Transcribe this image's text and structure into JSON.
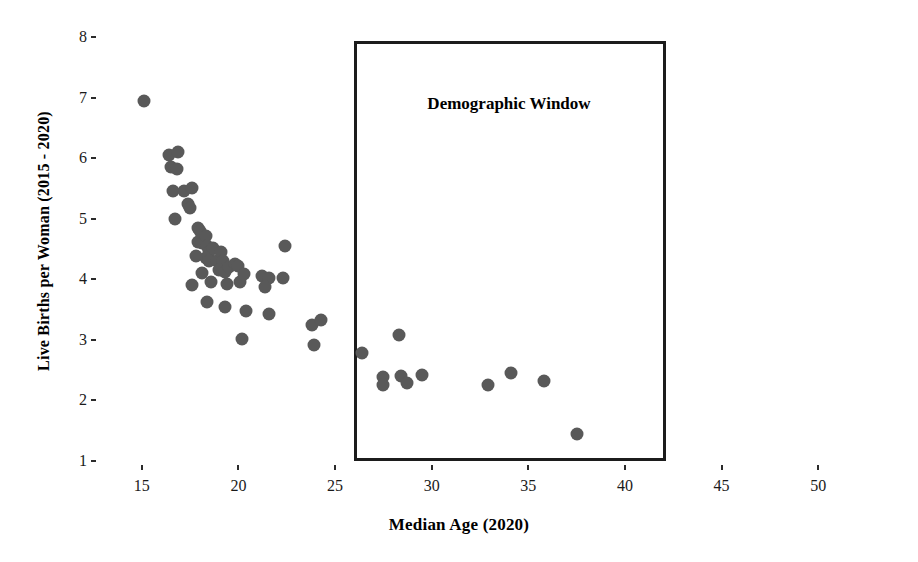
{
  "chart_data": {
    "type": "scatter",
    "title": "",
    "xlabel": "Median Age (2020)",
    "ylabel": "Live Births per Woman (2015 - 2020)",
    "xlim": [
      13.1,
      51.9
    ],
    "ylim": [
      1,
      8
    ],
    "xticks": [
      15,
      20,
      25,
      30,
      35,
      40,
      45,
      50
    ],
    "yticks": [
      1,
      2,
      3,
      4,
      5,
      6,
      7,
      8
    ],
    "grid": false,
    "legend": null,
    "marker_color": "#595959",
    "annotations": [
      {
        "name": "demographic-window",
        "label": "Demographic Window",
        "x_range": [
          26.0,
          42.1
        ],
        "y_range": [
          1.0,
          7.93
        ],
        "label_x": 34.0,
        "label_y": 6.9
      }
    ],
    "points": [
      {
        "x": 15.1,
        "y": 6.95
      },
      {
        "x": 16.4,
        "y": 6.05
      },
      {
        "x": 16.5,
        "y": 5.85
      },
      {
        "x": 16.9,
        "y": 6.1
      },
      {
        "x": 16.8,
        "y": 5.82
      },
      {
        "x": 16.6,
        "y": 5.45
      },
      {
        "x": 17.2,
        "y": 5.45
      },
      {
        "x": 17.6,
        "y": 5.5
      },
      {
        "x": 17.4,
        "y": 5.25
      },
      {
        "x": 17.5,
        "y": 5.18
      },
      {
        "x": 16.7,
        "y": 5.0
      },
      {
        "x": 17.9,
        "y": 4.85
      },
      {
        "x": 18.0,
        "y": 4.8
      },
      {
        "x": 17.9,
        "y": 4.62
      },
      {
        "x": 18.1,
        "y": 4.6
      },
      {
        "x": 18.3,
        "y": 4.72
      },
      {
        "x": 18.4,
        "y": 4.55
      },
      {
        "x": 18.5,
        "y": 4.45
      },
      {
        "x": 18.7,
        "y": 4.52
      },
      {
        "x": 18.3,
        "y": 4.35
      },
      {
        "x": 18.5,
        "y": 4.3
      },
      {
        "x": 18.9,
        "y": 4.3
      },
      {
        "x": 19.1,
        "y": 4.45
      },
      {
        "x": 19.2,
        "y": 4.3
      },
      {
        "x": 19.0,
        "y": 4.15
      },
      {
        "x": 19.3,
        "y": 4.12
      },
      {
        "x": 19.5,
        "y": 4.2
      },
      {
        "x": 19.8,
        "y": 4.25
      },
      {
        "x": 20.0,
        "y": 4.22
      },
      {
        "x": 18.1,
        "y": 4.1
      },
      {
        "x": 17.8,
        "y": 4.38
      },
      {
        "x": 18.6,
        "y": 3.95
      },
      {
        "x": 18.4,
        "y": 3.62
      },
      {
        "x": 17.6,
        "y": 3.9
      },
      {
        "x": 19.4,
        "y": 3.92
      },
      {
        "x": 19.3,
        "y": 3.55
      },
      {
        "x": 20.1,
        "y": 3.95
      },
      {
        "x": 20.3,
        "y": 4.08
      },
      {
        "x": 21.2,
        "y": 4.05
      },
      {
        "x": 21.6,
        "y": 4.02
      },
      {
        "x": 22.4,
        "y": 4.55
      },
      {
        "x": 22.3,
        "y": 4.02
      },
      {
        "x": 21.4,
        "y": 3.88
      },
      {
        "x": 20.4,
        "y": 3.48
      },
      {
        "x": 21.6,
        "y": 3.42
      },
      {
        "x": 20.2,
        "y": 3.02
      },
      {
        "x": 23.8,
        "y": 3.25
      },
      {
        "x": 24.3,
        "y": 3.32
      },
      {
        "x": 23.9,
        "y": 2.92
      },
      {
        "x": 26.4,
        "y": 2.78
      },
      {
        "x": 27.5,
        "y": 2.38
      },
      {
        "x": 27.5,
        "y": 2.25
      },
      {
        "x": 28.3,
        "y": 3.08
      },
      {
        "x": 28.4,
        "y": 2.4
      },
      {
        "x": 28.7,
        "y": 2.28
      },
      {
        "x": 29.5,
        "y": 2.42
      },
      {
        "x": 32.9,
        "y": 2.25
      },
      {
        "x": 34.1,
        "y": 2.45
      },
      {
        "x": 35.8,
        "y": 2.32
      },
      {
        "x": 37.5,
        "y": 1.45
      }
    ]
  },
  "axes": {
    "ylabel_text": "Live Births per Woman (2015 - 2020)",
    "xlabel_text": "Median Age (2020)"
  }
}
